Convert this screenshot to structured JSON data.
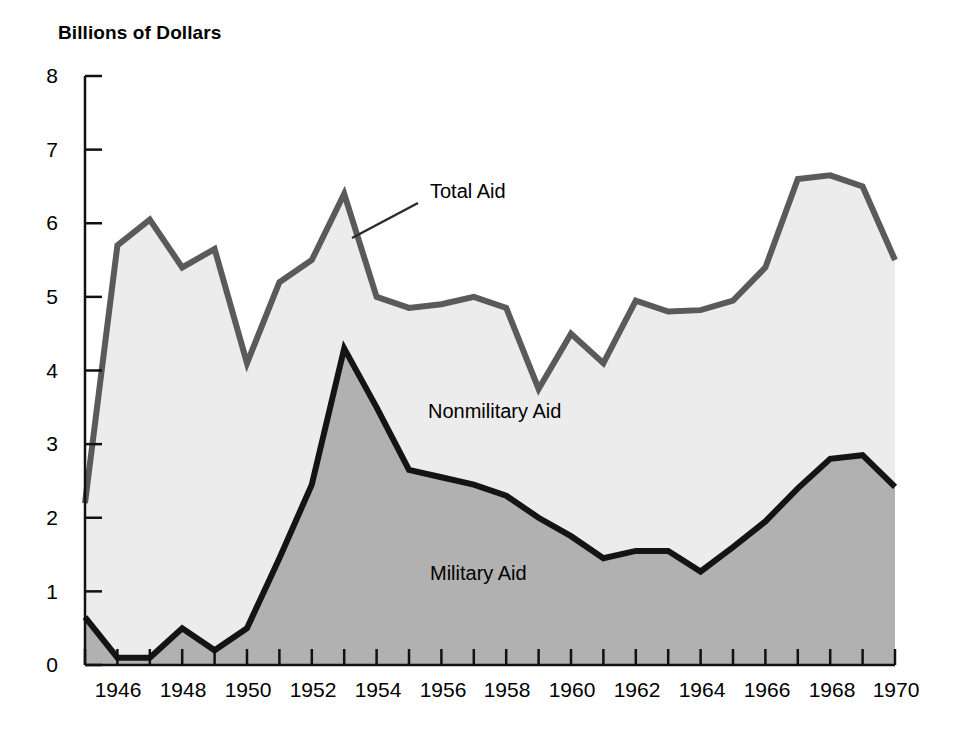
{
  "chart_data": {
    "type": "area",
    "title": "Billions of Dollars",
    "subtitle": "",
    "xlabel": "",
    "ylabel": "Billions of Dollars",
    "xlim": [
      1945,
      1970
    ],
    "ylim": [
      0,
      8
    ],
    "grid": false,
    "stacked": true,
    "legend_position": "inline-annotations",
    "x": [
      1945,
      1946,
      1947,
      1948,
      1949,
      1950,
      1951,
      1952,
      1953,
      1954,
      1955,
      1956,
      1957,
      1958,
      1959,
      1960,
      1961,
      1962,
      1963,
      1964,
      1965,
      1966,
      1967,
      1968,
      1969,
      1970
    ],
    "x_tick_labels": [
      "1946",
      "1948",
      "1950",
      "1952",
      "1954",
      "1956",
      "1958",
      "1960",
      "1962",
      "1964",
      "1966",
      "1968",
      "1970"
    ],
    "x_tick_values": [
      1946,
      1948,
      1950,
      1952,
      1954,
      1956,
      1958,
      1960,
      1962,
      1964,
      1966,
      1968,
      1970
    ],
    "y_tick_labels": [
      "0",
      "1",
      "2",
      "3",
      "4",
      "5",
      "6",
      "7",
      "8"
    ],
    "y_tick_values": [
      0,
      1,
      2,
      3,
      4,
      5,
      6,
      7,
      8
    ],
    "series": [
      {
        "name": "Military Aid",
        "fill_color": "#b1b1b1",
        "line_color": "#141414",
        "values": [
          0.65,
          0.1,
          0.1,
          0.5,
          0.2,
          0.5,
          1.45,
          2.45,
          4.3,
          3.5,
          2.65,
          2.55,
          2.45,
          2.3,
          2.0,
          1.75,
          1.45,
          1.55,
          1.55,
          1.27,
          1.6,
          1.95,
          2.4,
          2.8,
          2.85,
          2.42
        ]
      },
      {
        "name": "Nonmilitary Aid",
        "fill_color": "#ececec",
        "line_color": "#5a5a5a",
        "values": [
          1.55,
          5.6,
          5.95,
          4.9,
          5.45,
          3.6,
          3.75,
          3.05,
          2.1,
          1.5,
          2.2,
          2.35,
          2.55,
          2.55,
          1.75,
          2.75,
          2.65,
          3.4,
          3.25,
          3.55,
          3.35,
          3.45,
          4.2,
          3.85,
          3.65,
          3.08
        ]
      }
    ],
    "total_series": {
      "name": "Total Aid",
      "line_color": "#5a5a5a",
      "values": [
        2.2,
        5.7,
        6.05,
        5.4,
        5.65,
        4.1,
        5.2,
        5.5,
        6.4,
        5.0,
        4.85,
        4.9,
        5.0,
        4.85,
        3.75,
        4.5,
        4.1,
        4.95,
        4.8,
        4.82,
        4.95,
        5.4,
        6.6,
        6.65,
        6.5,
        5.5
      ]
    },
    "annotations": [
      {
        "name": "total-aid-label",
        "text": "Total Aid",
        "x_px": 430,
        "y_px": 190,
        "leader": {
          "x1": 418,
          "y1": 203,
          "x2": 352,
          "y2": 238
        }
      },
      {
        "name": "nonmilitary-aid-label",
        "text": "Nonmilitary Aid",
        "x_px": 428,
        "y_px": 410
      },
      {
        "name": "military-aid-label",
        "text": "Military Aid",
        "x_px": 430,
        "y_px": 572
      }
    ]
  },
  "axis": {
    "y_title": "Billions of Dollars"
  }
}
